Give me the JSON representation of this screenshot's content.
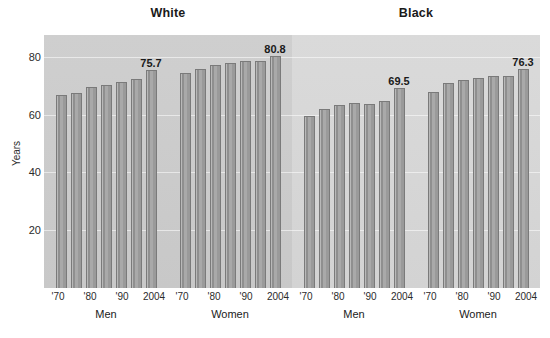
{
  "chart_data": {
    "type": "bar",
    "title": "",
    "xlabel": "",
    "ylabel": "Years",
    "ylim": [
      0,
      88
    ],
    "yticks": [
      20,
      40,
      60,
      80
    ],
    "grid": true,
    "legend": "none",
    "panel_titles": [
      "White",
      "Black"
    ],
    "group_labels": [
      "Men",
      "Women",
      "Men",
      "Women"
    ],
    "categories": [
      "'70",
      "",
      "'80",
      "",
      "'90",
      "",
      "2004"
    ],
    "tick_positions": [
      0,
      2,
      4,
      6
    ],
    "tick_labels": [
      "'70",
      "'80",
      "'90",
      "2004"
    ],
    "series": [
      {
        "name": "White Men",
        "race": "White",
        "sex": "Men",
        "values": [
          67.1,
          68.0,
          70.0,
          70.7,
          71.8,
          72.7,
          75.7
        ],
        "labeled_index": 6,
        "labeled_value": "75.7"
      },
      {
        "name": "White Women",
        "race": "White",
        "sex": "Women",
        "values": [
          74.7,
          76.1,
          77.4,
          78.1,
          78.8,
          79.0,
          80.8
        ],
        "labeled_index": 6,
        "labeled_value": "80.8"
      },
      {
        "name": "Black Men",
        "race": "Black",
        "sex": "Men",
        "values": [
          60.0,
          62.4,
          63.8,
          64.5,
          64.0,
          64.9,
          69.5
        ],
        "labeled_index": 6,
        "labeled_value": "69.5"
      },
      {
        "name": "Black Women",
        "race": "Black",
        "sex": "Women",
        "values": [
          68.3,
          71.3,
          72.5,
          73.0,
          73.6,
          73.9,
          76.3
        ],
        "labeled_index": 6,
        "labeled_value": "76.3"
      }
    ],
    "colors": {
      "bar_fill": "#a9a9a9",
      "bar_edge": "#7a7a7a",
      "panel_white_bg": "#cfcfcf",
      "panel_black_bg": "#dadada",
      "gridline": "#ffffff",
      "text": "#1a1a1a"
    }
  }
}
